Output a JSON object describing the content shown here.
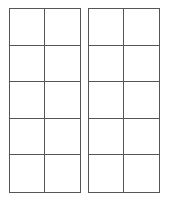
{
  "diagram": {
    "type": "ten-frames",
    "frames": [
      {
        "id": "left",
        "columns": 2,
        "rows": 5,
        "filled_cells": []
      },
      {
        "id": "right",
        "columns": 2,
        "rows": 5,
        "filled_cells": []
      }
    ],
    "line_color": "#555555",
    "background_color": "#ffffff"
  }
}
